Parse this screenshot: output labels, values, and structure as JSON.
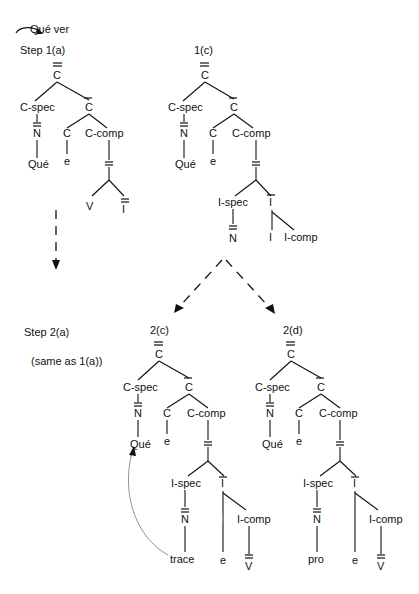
{
  "header": {
    "top_label": "Qué ver",
    "step1": "Step 1(a)",
    "label_1c": "1(c)",
    "step2": "Step 2(a)",
    "same_as": "(same as 1(a))",
    "label_2c": "2(c)",
    "label_2d": "2(d)"
  },
  "colors": {
    "ink": "#111111",
    "trace_arrow": "#777777",
    "background": "#ffffff"
  },
  "nodes": {
    "C": "C",
    "C_spec": "C-spec",
    "C_comp": "C-comp",
    "N": "N",
    "V": "V",
    "I": "I",
    "I_spec": "I-spec",
    "I_comp": "I-comp",
    "que": "Qué",
    "e": "e",
    "trace": "trace",
    "pro": "pro"
  },
  "trees": [
    {
      "id": "1a",
      "label": "Step 1(a)",
      "leaves": [
        "Qué",
        "e",
        "V",
        "I"
      ]
    },
    {
      "id": "1c",
      "label": "1(c)",
      "leaves": [
        "Qué",
        "e",
        "I-spec/N",
        "I",
        "I-comp"
      ]
    },
    {
      "id": "2c",
      "label": "2(c)",
      "leaves": [
        "Qué",
        "e",
        "trace",
        "e",
        "V"
      ]
    },
    {
      "id": "2d",
      "label": "2(d)",
      "leaves": [
        "Qué",
        "e",
        "pro",
        "e",
        "V"
      ]
    }
  ]
}
